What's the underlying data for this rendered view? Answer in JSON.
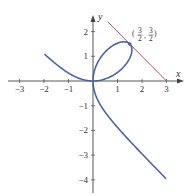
{
  "chart_data": {
    "type": "line",
    "title": "",
    "xlabel": "x",
    "ylabel": "y",
    "xlim": [
      -3.3,
      3.5
    ],
    "ylim": [
      -4.4,
      2.9
    ],
    "x_ticks": [
      -3,
      -2,
      -1,
      1,
      2,
      3
    ],
    "y_ticks": [
      -4,
      -3,
      -2,
      -1,
      1,
      2
    ],
    "x_tick_labels": [
      "−3",
      "−2",
      "−1",
      "1",
      "2",
      "3"
    ],
    "y_tick_labels": [
      "−4",
      "−3",
      "−2",
      "−1",
      "1",
      "2"
    ],
    "grid": false,
    "legend": null,
    "series": [
      {
        "name": "folium of Descartes x^3 + y^3 = 3xy",
        "color": "#4a63a8",
        "points_description": "loop through origin and (3/2, 3/2); branches to (-3, 2) and (3, -4)"
      },
      {
        "name": "tangent line x + y = 3",
        "color": "#b0507a",
        "x": [
          0.6,
          3
        ],
        "y": [
          2.4,
          0
        ]
      }
    ],
    "annotations": [
      {
        "text_num": "3",
        "text_den": "2",
        "point": [
          1.5,
          1.5
        ],
        "label": "(3/2, 3/2)"
      }
    ]
  },
  "axes": {
    "x_label": "x",
    "y_label": "y"
  },
  "annotation": {
    "num1": "3",
    "den1": "2",
    "num2": "3",
    "den2": "2"
  }
}
